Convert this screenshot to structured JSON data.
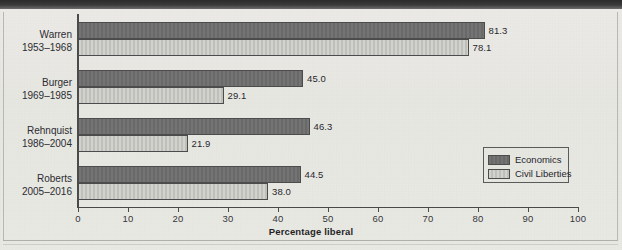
{
  "chart_data": {
    "type": "bar",
    "orientation": "horizontal",
    "title": "",
    "xlabel": "Percentage liberal",
    "ylabel": "",
    "xlim": [
      0,
      100
    ],
    "xticks": [
      0,
      10,
      20,
      30,
      40,
      50,
      60,
      70,
      80,
      90,
      100
    ],
    "grid": false,
    "legend_position": "lower-right",
    "categories": [
      "Warren",
      "Burger",
      "Rehnquist",
      "Roberts"
    ],
    "category_sublabels": [
      "1953–1968",
      "1969–1985",
      "1986–2004",
      "2005–2016"
    ],
    "series": [
      {
        "name": "Economics",
        "color": "#6d6d6d",
        "values": [
          81.3,
          45.0,
          46.3,
          44.5
        ]
      },
      {
        "name": "Civil Liberties",
        "color": "#c6c6c1",
        "values": [
          78.1,
          29.1,
          21.9,
          38.0
        ]
      }
    ],
    "value_labels": [
      [
        "81.3",
        "78.1"
      ],
      [
        "45.0",
        "29.1"
      ],
      [
        "46.3",
        "21.9"
      ],
      [
        "44.5",
        "38.0"
      ]
    ]
  },
  "axis": {
    "tick_labels": [
      "0",
      "10",
      "20",
      "30",
      "40",
      "50",
      "60",
      "70",
      "80",
      "90",
      "100"
    ],
    "title": "Percentage liberal"
  },
  "legend": {
    "items": [
      {
        "label": "Economics"
      },
      {
        "label": "Civil Liberties"
      }
    ]
  },
  "groups": [
    {
      "name": "Warren",
      "years": "1953–1968",
      "econ": 81.3,
      "civ": 78.1,
      "econ_label": "81.3",
      "civ_label": "78.1"
    },
    {
      "name": "Burger",
      "years": "1969–1985",
      "econ": 45.0,
      "civ": 29.1,
      "econ_label": "45.0",
      "civ_label": "29.1"
    },
    {
      "name": "Rehnquist",
      "years": "1986–2004",
      "econ": 46.3,
      "civ": 21.9,
      "econ_label": "46.3",
      "civ_label": "21.9"
    },
    {
      "name": "Roberts",
      "years": "2005–2016",
      "econ": 44.5,
      "civ": 38.0,
      "econ_label": "44.5",
      "civ_label": "38.0"
    }
  ],
  "colors": {
    "economics": "#6d6d6d",
    "civil_liberties": "#c6c6c1",
    "axis": "#4a4a4a",
    "page": "#e9e9e5"
  }
}
